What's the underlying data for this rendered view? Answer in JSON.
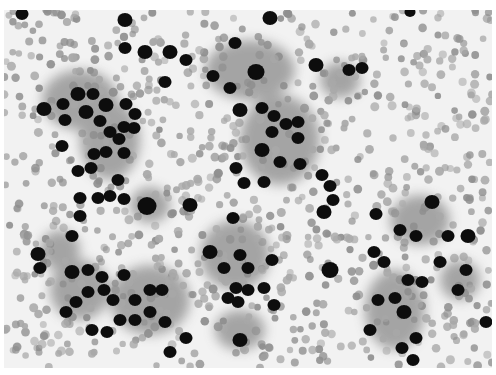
{
  "image": {
    "kind": "grayscale cytology micrograph",
    "area": {
      "x": 4,
      "y": 10,
      "w": 488,
      "h": 358
    },
    "colors": {
      "background": "#f2f2f2",
      "rbc": "#a8a8a8",
      "rbc_dark": "#8e8e8e",
      "cytoplasm": "#8a8a8a",
      "nucleus": "#0c0c0c"
    }
  },
  "cytoplasm": [
    [
      80,
      100,
      38,
      30
    ],
    [
      110,
      140,
      30,
      40
    ],
    [
      250,
      70,
      45,
      30
    ],
    [
      280,
      140,
      40,
      45
    ],
    [
      235,
      255,
      35,
      35
    ],
    [
      150,
      300,
      40,
      35
    ],
    [
      80,
      290,
      30,
      30
    ],
    [
      420,
      220,
      30,
      25
    ],
    [
      395,
      310,
      30,
      40
    ],
    [
      340,
      80,
      20,
      18
    ],
    [
      150,
      205,
      20,
      18
    ],
    [
      240,
      330,
      25,
      20
    ],
    [
      60,
      250,
      20,
      20
    ],
    [
      460,
      280,
      20,
      20
    ]
  ],
  "nuclei": [
    [
      22,
      14,
      6
    ],
    [
      125,
      20,
      7
    ],
    [
      125,
      48,
      6
    ],
    [
      145,
      52,
      7
    ],
    [
      170,
      52,
      7
    ],
    [
      186,
      60,
      6
    ],
    [
      235,
      43,
      6
    ],
    [
      270,
      18,
      7
    ],
    [
      410,
      12,
      5
    ],
    [
      256,
      72,
      8
    ],
    [
      213,
      76,
      6
    ],
    [
      230,
      88,
      6
    ],
    [
      165,
      82,
      6
    ],
    [
      316,
      65,
      7
    ],
    [
      349,
      70,
      6
    ],
    [
      362,
      68,
      6
    ],
    [
      44,
      109,
      7
    ],
    [
      63,
      104,
      6
    ],
    [
      78,
      94,
      7
    ],
    [
      93,
      94,
      6
    ],
    [
      106,
      105,
      7
    ],
    [
      126,
      104,
      6
    ],
    [
      135,
      114,
      6
    ],
    [
      65,
      120,
      6
    ],
    [
      86,
      112,
      7
    ],
    [
      100,
      121,
      6
    ],
    [
      110,
      132,
      6
    ],
    [
      124,
      127,
      6
    ],
    [
      134,
      128,
      6
    ],
    [
      119,
      139,
      6
    ],
    [
      62,
      146,
      6
    ],
    [
      94,
      154,
      6
    ],
    [
      106,
      152,
      6
    ],
    [
      124,
      153,
      6
    ],
    [
      91,
      168,
      6
    ],
    [
      78,
      171,
      6
    ],
    [
      118,
      180,
      6
    ],
    [
      240,
      110,
      7
    ],
    [
      262,
      108,
      6
    ],
    [
      274,
      116,
      6
    ],
    [
      286,
      124,
      6
    ],
    [
      298,
      122,
      6
    ],
    [
      272,
      132,
      6
    ],
    [
      298,
      138,
      6
    ],
    [
      262,
      150,
      7
    ],
    [
      280,
      162,
      6
    ],
    [
      300,
      164,
      6
    ],
    [
      236,
      168,
      6
    ],
    [
      244,
      183,
      6
    ],
    [
      264,
      182,
      6
    ],
    [
      322,
      175,
      6
    ],
    [
      330,
      186,
      6
    ],
    [
      333,
      200,
      6
    ],
    [
      324,
      212,
      7
    ],
    [
      80,
      198,
      6
    ],
    [
      98,
      198,
      6
    ],
    [
      110,
      196,
      6
    ],
    [
      124,
      199,
      6
    ],
    [
      190,
      205,
      7
    ],
    [
      147,
      206,
      9
    ],
    [
      80,
      216,
      6
    ],
    [
      233,
      218,
      6
    ],
    [
      376,
      214,
      6
    ],
    [
      400,
      230,
      6
    ],
    [
      432,
      202,
      7
    ],
    [
      416,
      236,
      6
    ],
    [
      468,
      236,
      7
    ],
    [
      448,
      236,
      6
    ],
    [
      72,
      236,
      6
    ],
    [
      38,
      254,
      7
    ],
    [
      40,
      268,
      6
    ],
    [
      72,
      272,
      7
    ],
    [
      88,
      270,
      6
    ],
    [
      102,
      277,
      6
    ],
    [
      124,
      275,
      6
    ],
    [
      88,
      292,
      6
    ],
    [
      104,
      290,
      6
    ],
    [
      113,
      300,
      6
    ],
    [
      135,
      300,
      6
    ],
    [
      150,
      290,
      6
    ],
    [
      162,
      290,
      6
    ],
    [
      150,
      312,
      6
    ],
    [
      120,
      320,
      6
    ],
    [
      135,
      320,
      6
    ],
    [
      165,
      322,
      6
    ],
    [
      107,
      332,
      6
    ],
    [
      92,
      330,
      6
    ],
    [
      66,
      312,
      6
    ],
    [
      76,
      302,
      6
    ],
    [
      170,
      352,
      6
    ],
    [
      210,
      252,
      7
    ],
    [
      240,
      255,
      6
    ],
    [
      248,
      268,
      6
    ],
    [
      224,
      268,
      6
    ],
    [
      236,
      288,
      6
    ],
    [
      248,
      290,
      6
    ],
    [
      264,
      288,
      6
    ],
    [
      272,
      260,
      6
    ],
    [
      228,
      298,
      6
    ],
    [
      238,
      302,
      6
    ],
    [
      274,
      305,
      6
    ],
    [
      240,
      340,
      7
    ],
    [
      330,
      270,
      8
    ],
    [
      374,
      252,
      6
    ],
    [
      384,
      262,
      6
    ],
    [
      440,
      262,
      6
    ],
    [
      466,
      270,
      6
    ],
    [
      458,
      290,
      6
    ],
    [
      408,
      280,
      6
    ],
    [
      422,
      282,
      6
    ],
    [
      378,
      300,
      6
    ],
    [
      395,
      298,
      6
    ],
    [
      404,
      312,
      7
    ],
    [
      416,
      338,
      6
    ],
    [
      402,
      348,
      6
    ],
    [
      370,
      330,
      6
    ],
    [
      486,
      322,
      6
    ],
    [
      413,
      360,
      6
    ],
    [
      186,
      338,
      6
    ]
  ],
  "rbc_seed": 17,
  "rbc_count": 900
}
